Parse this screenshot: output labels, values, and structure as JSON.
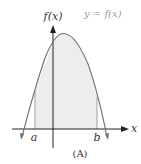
{
  "figure": {
    "caption": "(A)",
    "y_axis_label": "f(x)",
    "x_axis_label": "x",
    "curve_label": "y = f(x)",
    "left_bound_label": "a",
    "right_bound_label": "b"
  },
  "colors": {
    "curve": "#6e6e6e",
    "axes": "#222222",
    "shaded_region": "#ededed",
    "bound_lines": "#8a8a8a",
    "curve_label": "#9a9a9a"
  }
}
